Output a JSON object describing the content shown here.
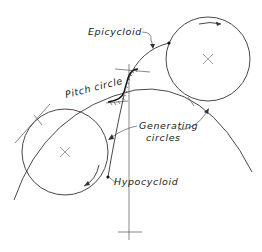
{
  "diagram": {
    "labels": {
      "epicycloid": "Epicycloid",
      "pitch_circle": "Pitch circle",
      "generating_line1": "Generating",
      "generating_line2": "circles",
      "hypocycloid": "Hypocycloid"
    },
    "elements": {
      "upper_generating_circle": {
        "center": [
          208,
          59
        ],
        "radius": 42,
        "rotation": "clockwise"
      },
      "lower_generating_circle": {
        "center": [
          65,
          152
        ],
        "radius": 43,
        "rotation": "clockwise"
      },
      "pitch_circle": "large arc through tooth profile",
      "tooth_profile": "epicycloid face above pitch circle, hypocycloid flank below"
    },
    "colors": {
      "ink": "#333333",
      "background": "#ffffff"
    }
  }
}
